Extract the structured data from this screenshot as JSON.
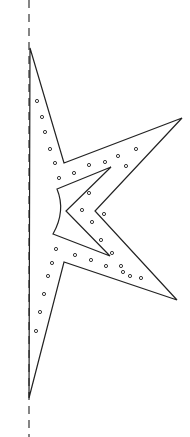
{
  "colors": {
    "background": "#ffffff",
    "stroke": "#222222",
    "dashed": "#444444"
  },
  "fold_line": {
    "x": 29,
    "y1": 0,
    "y2": 437,
    "dash": "8,6"
  },
  "outer_outline": "30,48 64,163 182,118 95,211 177,300 64,262 29,398",
  "inner_cutout": "111,167 57,189 Q66,211 53,234 110,256 66,211",
  "holes": [
    [
      37,
      101
    ],
    [
      42,
      117
    ],
    [
      45,
      132
    ],
    [
      50,
      149
    ],
    [
      55,
      163
    ],
    [
      59,
      178
    ],
    [
      89,
      165
    ],
    [
      105,
      162
    ],
    [
      118,
      156
    ],
    [
      136,
      149
    ],
    [
      126,
      166
    ],
    [
      74,
      173
    ],
    [
      89,
      193
    ],
    [
      104,
      214
    ],
    [
      82,
      210
    ],
    [
      92,
      222
    ],
    [
      101,
      240
    ],
    [
      112,
      253
    ],
    [
      121,
      266
    ],
    [
      130,
      276
    ],
    [
      141,
      278
    ],
    [
      56,
      249
    ],
    [
      75,
      255
    ],
    [
      91,
      260
    ],
    [
      106,
      266
    ],
    [
      123,
      272
    ],
    [
      52,
      263
    ],
    [
      48,
      276
    ],
    [
      44,
      294
    ],
    [
      40,
      312
    ],
    [
      36,
      331
    ]
  ]
}
